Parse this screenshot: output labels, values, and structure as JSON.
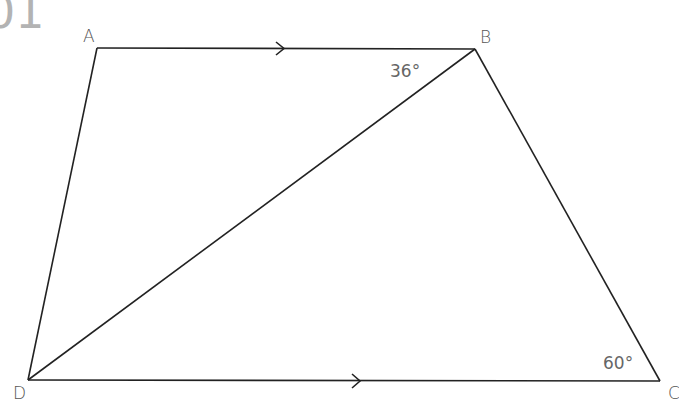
{
  "header": {
    "text": "01"
  },
  "diagram": {
    "vertices": {
      "A": {
        "label": "A",
        "x": 97,
        "y": 48
      },
      "B": {
        "label": "B",
        "x": 475,
        "y": 49
      },
      "C": {
        "label": "C",
        "x": 660,
        "y": 381
      },
      "D": {
        "label": "D",
        "x": 28,
        "y": 380
      }
    },
    "edges": [
      "AB",
      "BC",
      "CD",
      "DA",
      "BD"
    ],
    "parallel_marks": [
      "AB",
      "DC"
    ],
    "angles": [
      {
        "label": "36°",
        "at": "B",
        "between": "AB and BD"
      },
      {
        "label": "60°",
        "at": "C",
        "between": "BC and DC"
      }
    ]
  },
  "colors": {
    "line": "#222222",
    "label": "#555555",
    "header": "#b3b3b3"
  }
}
